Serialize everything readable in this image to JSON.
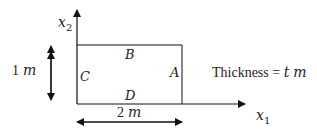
{
  "axes": {
    "x_label": "x",
    "x_sub": "1",
    "y_label": "x",
    "y_sub": "2"
  },
  "labels": {
    "A": "A",
    "B": "B",
    "C": "C",
    "D": "D"
  },
  "dimensions": {
    "height_num": "1",
    "height_unit": "m",
    "width_num": "2",
    "width_unit": "m"
  },
  "thickness": {
    "text": "Thickness = ",
    "var": "t",
    "unit": "m"
  }
}
